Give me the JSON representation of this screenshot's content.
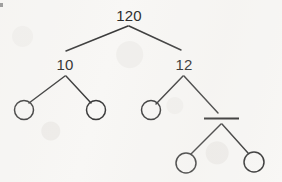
{
  "diagram": {
    "type": "binary-tree",
    "background_color": "#f8f7f5",
    "ink_color": "#3a3a3a",
    "nodes": [
      {
        "id": "root",
        "label": "120",
        "kind": "labeled",
        "x": 129,
        "y": 15,
        "depth": 0
      },
      {
        "id": "left",
        "label": "10",
        "kind": "labeled",
        "x": 65,
        "y": 64,
        "depth": 1
      },
      {
        "id": "right",
        "label": "12",
        "kind": "labeled",
        "x": 184,
        "y": 64,
        "depth": 1
      },
      {
        "id": "left-left",
        "label": "",
        "kind": "empty-circle",
        "x": 24,
        "y": 110,
        "radius": 9.5,
        "depth": 2
      },
      {
        "id": "left-right",
        "label": "",
        "kind": "empty-circle",
        "x": 96,
        "y": 110,
        "radius": 9.5,
        "depth": 2
      },
      {
        "id": "right-left",
        "label": "",
        "kind": "empty-circle",
        "x": 151,
        "y": 110,
        "radius": 9.5,
        "depth": 2
      },
      {
        "id": "right-right",
        "label": "",
        "kind": "redacted-bar",
        "x": 221,
        "y": 118,
        "bar_x1": 204,
        "bar_x2": 239,
        "depth": 2
      },
      {
        "id": "right-right-left",
        "label": "",
        "kind": "empty-circle",
        "x": 186,
        "y": 163,
        "radius": 10,
        "depth": 3
      },
      {
        "id": "right-right-right",
        "label": "",
        "kind": "empty-circle",
        "x": 254,
        "y": 162,
        "radius": 10,
        "depth": 3
      }
    ],
    "edges": [
      {
        "id": "edge-root-left",
        "from": "root",
        "to": "left",
        "x1": 128,
        "y1": 26,
        "x2": 66,
        "y2": 51
      },
      {
        "id": "edge-root-right",
        "from": "root",
        "to": "right",
        "x1": 129,
        "y1": 26,
        "x2": 181,
        "y2": 50
      },
      {
        "id": "edge-left-left",
        "from": "left",
        "to": "left-left",
        "x1": 65,
        "y1": 76,
        "x2": 29,
        "y2": 103
      },
      {
        "id": "edge-left-right",
        "from": "left",
        "to": "left-right",
        "x1": 66,
        "y1": 76,
        "x2": 91,
        "y2": 103
      },
      {
        "id": "edge-right-left",
        "from": "right",
        "to": "right-left",
        "x1": 183,
        "y1": 76,
        "x2": 156,
        "y2": 104
      },
      {
        "id": "edge-right-right",
        "from": "right",
        "to": "right-right",
        "x1": 184,
        "y1": 76,
        "x2": 218,
        "y2": 113
      },
      {
        "id": "edge-rr-left",
        "from": "right-right",
        "to": "right-right-left",
        "x1": 221,
        "y1": 124,
        "x2": 191,
        "y2": 154
      },
      {
        "id": "edge-rr-right",
        "from": "right-right",
        "to": "right-right-right",
        "x1": 222,
        "y1": 124,
        "x2": 248,
        "y2": 153
      }
    ],
    "corner_mark": {
      "id": "corner-mark",
      "x": 0,
      "y": 3,
      "width": 3,
      "height": 4
    }
  }
}
